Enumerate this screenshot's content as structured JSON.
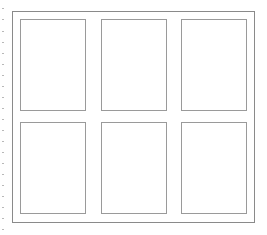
{
  "diagram": {
    "type": "panel-grid",
    "rows": 2,
    "columns": 3,
    "frame": {
      "border_color": "#8a8a8a"
    },
    "panel_border_color": "#9a9a9a",
    "panels": [
      {
        "id": "panel-1",
        "row": 1,
        "col": 1
      },
      {
        "id": "panel-2",
        "row": 1,
        "col": 2
      },
      {
        "id": "panel-3",
        "row": 1,
        "col": 3
      },
      {
        "id": "panel-4",
        "row": 2,
        "col": 1
      },
      {
        "id": "panel-5",
        "row": 2,
        "col": 2
      },
      {
        "id": "panel-6",
        "row": 2,
        "col": 3
      }
    ]
  }
}
